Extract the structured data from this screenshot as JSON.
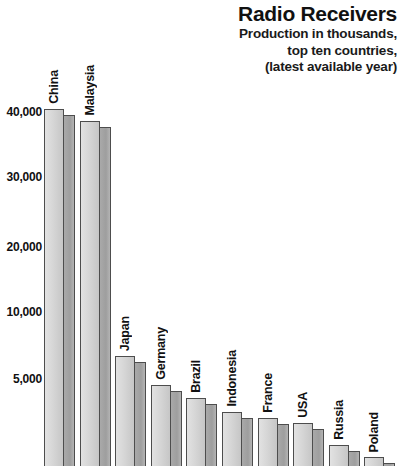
{
  "header": {
    "title": "Radio Receivers",
    "subtitle_lines": [
      "Production in thousands,",
      "top ten countries,",
      "(latest available year)"
    ]
  },
  "axis": {
    "y_ticks": [
      {
        "label": "40,000",
        "value": 40000,
        "y": 113
      },
      {
        "label": "30,000",
        "value": 30000,
        "y": 178
      },
      {
        "label": "20,000",
        "value": 20000,
        "y": 248
      },
      {
        "label": "10,000",
        "value": 10000,
        "y": 313
      },
      {
        "label": "5,000",
        "value": 5000,
        "y": 380
      }
    ],
    "baseline_y": 466
  },
  "style": {
    "background": "#ffffff",
    "text_color": "#111111",
    "bar_front_light": "#e2e2e2",
    "bar_front_dark": "#c6c6c6",
    "bar_side_color": "#a9a9a9",
    "bar_outline": "#4d4d4d"
  },
  "chart_data": {
    "type": "bar",
    "title": "Radio Receivers",
    "subtitle": "Production in thousands, top ten countries, (latest available year)",
    "xlabel": "",
    "ylabel": "Production in thousands",
    "grid": false,
    "legend": "none",
    "axis_note": "non-linear y-axis: spacing between 5,000 and 10,000 matches spacing between 10,000 and 20,000",
    "ylim": [
      0,
      42000
    ],
    "categories": [
      "China",
      "Malaysia",
      "Japan",
      "Germany",
      "Brazil",
      "Indonesia",
      "France",
      "USA",
      "Russia",
      "Poland"
    ],
    "values": [
      41500,
      39000,
      7200,
      5200,
      4200,
      3300,
      2900,
      2600,
      1300,
      700
    ],
    "bars": [
      {
        "label": "China",
        "value": 41500,
        "top_y": 109
      },
      {
        "label": "Malaysia",
        "value": 39000,
        "top_y": 121
      },
      {
        "label": "Japan",
        "value": 7200,
        "top_y": 356
      },
      {
        "label": "Germany",
        "value": 5200,
        "top_y": 385
      },
      {
        "label": "Brazil",
        "value": 4200,
        "top_y": 398
      },
      {
        "label": "Indonesia",
        "value": 3300,
        "top_y": 412
      },
      {
        "label": "France",
        "value": 2900,
        "top_y": 418
      },
      {
        "label": "USA",
        "value": 2600,
        "top_y": 423
      },
      {
        "label": "Russia",
        "value": 1300,
        "top_y": 445
      },
      {
        "label": "Poland",
        "value": 700,
        "top_y": 457
      }
    ],
    "layout": {
      "plot_left": 42,
      "bar_first_x": 2,
      "bar_pitch": 35.6,
      "bar_front_width": 20,
      "bar_side_width": 11,
      "side_offset_y": 6,
      "label_gap": 5
    }
  }
}
